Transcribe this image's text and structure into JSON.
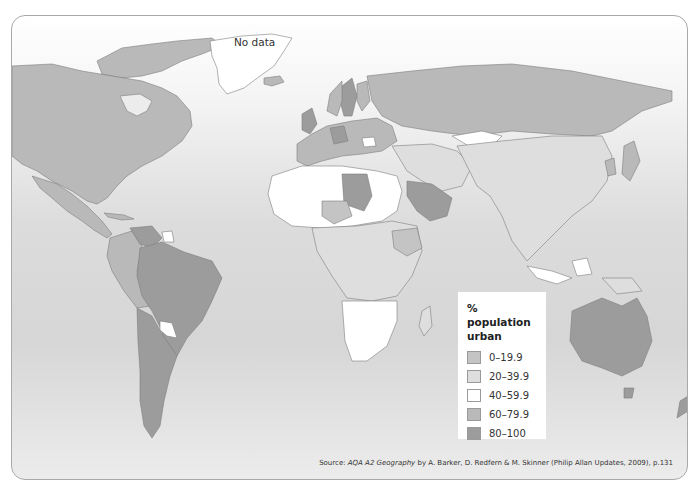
{
  "map": {
    "title": "% population urban",
    "no_data_label": "No data",
    "colors": {
      "ocean_top": "#ffffff",
      "ocean_mid": "#d8d8d8",
      "no_data": "#ffffff",
      "border": "#7d7d7d"
    }
  },
  "legend": {
    "title_line1": "% population",
    "title_line2": "urban",
    "items": [
      {
        "label": "0–19.9",
        "color": "#c4c4c4"
      },
      {
        "label": "20–39.9",
        "color": "#dedede"
      },
      {
        "label": "40–59.9",
        "color": "#ffffff"
      },
      {
        "label": "60–79.9",
        "color": "#b9b9b9"
      },
      {
        "label": "80–100",
        "color": "#9c9c9c"
      }
    ]
  },
  "regions": [
    {
      "name": "North America (USA/Canada)",
      "class": "60–79.9"
    },
    {
      "name": "Mexico / Central America",
      "class": "60–79.9"
    },
    {
      "name": "Greenland",
      "class": "No data"
    },
    {
      "name": "Venezuela",
      "class": "80–100"
    },
    {
      "name": "Brazil",
      "class": "80–100"
    },
    {
      "name": "Argentina / Chile / Uruguay",
      "class": "80–100"
    },
    {
      "name": "Colombia / Peru / Bolivia",
      "class": "60–79.9"
    },
    {
      "name": "Paraguay / Guyana",
      "class": "40–59.9"
    },
    {
      "name": "UK / Germany / Sweden",
      "class": "80–100"
    },
    {
      "name": "Rest of Europe",
      "class": "60–79.9"
    },
    {
      "name": "Russia",
      "class": "60–79.9"
    },
    {
      "name": "Kazakhstan",
      "class": "40–59.9"
    },
    {
      "name": "Libya / Saudi Arabia",
      "class": "80–100"
    },
    {
      "name": "Algeria / Egypt / West Africa",
      "class": "40–59.9"
    },
    {
      "name": "Niger / Ethiopia / Uganda",
      "class": "0–19.9"
    },
    {
      "name": "Central & East Africa",
      "class": "20–39.9"
    },
    {
      "name": "Southern Africa",
      "class": "40–59.9"
    },
    {
      "name": "China / India / SE Asia",
      "class": "20–39.9"
    },
    {
      "name": "Japan / Korea",
      "class": "60–79.9"
    },
    {
      "name": "Indonesia (parts) / Malaysia",
      "class": "40–59.9"
    },
    {
      "name": "Australia / New Zealand",
      "class": "80–100"
    }
  ],
  "source": {
    "prefix": "Source: ",
    "title": "AQA A2 Geography",
    "rest": " by A. Barker, D. Redfern & M. Skinner (Philip Allan Updates, 2009), p.131"
  }
}
